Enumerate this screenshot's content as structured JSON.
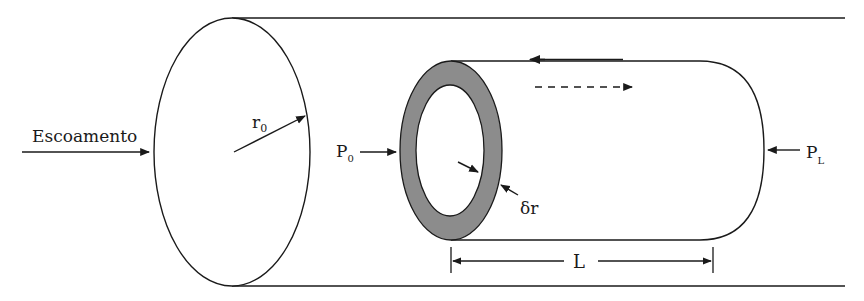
{
  "diagram": {
    "type": "annular fluid element in pipe flow (Hagen-Poiseuille derivation)",
    "labels": {
      "flow": "Escoamento",
      "radius_symbol": "r",
      "radius_subscript": "0",
      "inlet_pressure_symbol": "P",
      "inlet_pressure_subscript": "0",
      "outlet_pressure_symbol": "P",
      "outlet_pressure_subscript": "L",
      "shell_thickness": "δr",
      "length": "L"
    },
    "colors": {
      "stroke": "#1a1a1a",
      "annulus_fill": "#8c8c8c",
      "background": "#ffffff"
    },
    "elements": [
      "outer pipe (cylinder)",
      "pipe cross-section ellipse with radius arrow r0",
      "annular cylindrical shell element",
      "shear stress arrow on outer surface (leftward)",
      "velocity dashed arrow (rightward)",
      "pressure arrows P0 and PL",
      "thickness arrows δr",
      "length dimension L"
    ]
  }
}
